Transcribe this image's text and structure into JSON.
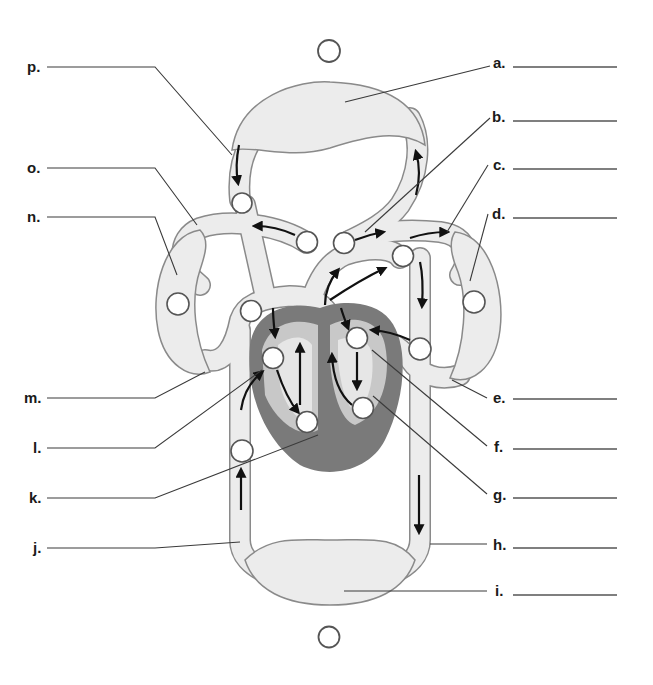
{
  "diagram": {
    "structures": {
      "top_capillary_bed": "lung/upper body capillary network (top)",
      "left_capillary_bed": "left side capillary network",
      "right_capillary_bed": "right side capillary network",
      "bottom_capillary_bed": "lower body capillary network",
      "heart": "four-chambered heart (center)"
    },
    "blank_circles": {
      "top_standalone": "",
      "bottom_standalone": "",
      "count_on_vessels": 14
    },
    "labels_left": [
      {
        "letter": "p.",
        "answer": ""
      },
      {
        "letter": "o.",
        "answer": ""
      },
      {
        "letter": "n.",
        "answer": ""
      },
      {
        "letter": "m.",
        "answer": ""
      },
      {
        "letter": "l.",
        "answer": ""
      },
      {
        "letter": "k.",
        "answer": ""
      },
      {
        "letter": "j.",
        "answer": ""
      }
    ],
    "labels_right": [
      {
        "letter": "a.",
        "answer": ""
      },
      {
        "letter": "b.",
        "answer": ""
      },
      {
        "letter": "c.",
        "answer": ""
      },
      {
        "letter": "d.",
        "answer": ""
      },
      {
        "letter": "e.",
        "answer": ""
      },
      {
        "letter": "f.",
        "answer": ""
      },
      {
        "letter": "g.",
        "answer": ""
      },
      {
        "letter": "h.",
        "answer": ""
      },
      {
        "letter": "i.",
        "answer": ""
      }
    ],
    "colors": {
      "vessel_fill": "#ececec",
      "vessel_outline": "#8a8a8a",
      "heart_wall": "#7a7a7a",
      "heart_chamber": "#c8c8c8",
      "label_text": "#1a1a1a"
    }
  }
}
